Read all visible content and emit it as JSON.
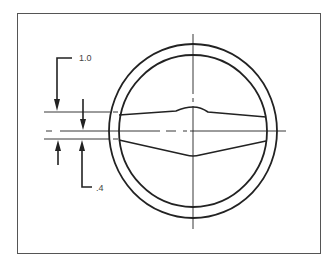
{
  "diagram": {
    "dimensions": [
      {
        "label": "1.0",
        "description": "upper offset dimension"
      },
      {
        "label": ".4",
        "description": "lower offset dimension"
      }
    ],
    "colors": {
      "line": "#222222",
      "frame": "#555555",
      "background": "#ffffff"
    }
  }
}
